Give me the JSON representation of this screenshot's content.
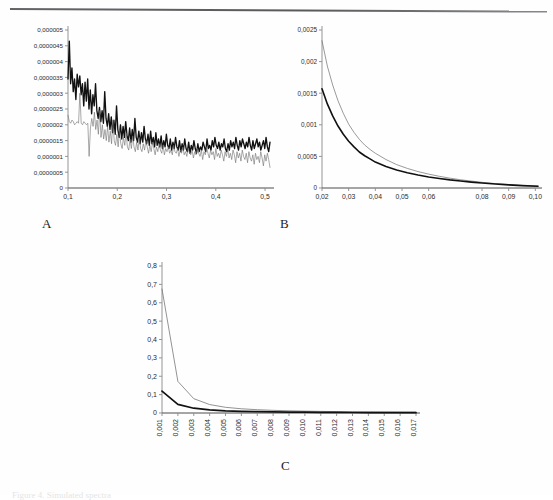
{
  "figure": {
    "caption_partial": "Figure 4. Simulated spectra",
    "panels": [
      "A",
      "B",
      "C"
    ],
    "top_rule": true
  },
  "colors": {
    "series_thick": "#111111",
    "series_thin": "#6f6f6f",
    "axis": "#8a8a8a",
    "text": "#2b2b2b",
    "background": "#fefefe"
  },
  "chart_data": [
    {
      "id": "A",
      "type": "line",
      "title": "",
      "xlabel": "",
      "ylabel": "",
      "grid": false,
      "legend": "none",
      "xlim": [
        0.1,
        0.51
      ],
      "ylim": [
        0,
        5e-06
      ],
      "xticks": [
        "0,1",
        "0,2",
        "0,3",
        "0,4",
        "0,5"
      ],
      "xtick_values": [
        0.1,
        0.2,
        0.3,
        0.4,
        0.5
      ],
      "yticks": [
        "0",
        "0,0000005",
        "0,000001",
        "0,0000015",
        "0,000002",
        "0,0000025",
        "0,000003",
        "0,0000035",
        "0,000004",
        "0,0000045",
        "0,000005"
      ],
      "ytick_values": [
        0,
        5e-07,
        1e-06,
        1.5e-06,
        2e-06,
        2.5e-06,
        3e-06,
        3.5e-06,
        4e-06,
        4.5e-06,
        5e-06
      ],
      "series": [
        {
          "name": "thick-black",
          "style": "thick",
          "values": [
            3.45,
            4.65,
            3.3,
            3.8,
            3.05,
            3.45,
            2.8,
            3.6,
            3.2,
            3.55,
            2.95,
            3.3,
            2.6,
            3.35,
            2.75,
            3.45,
            2.5,
            3.1,
            2.35,
            2.95,
            2.6,
            3.3,
            2.45,
            2.2,
            2.55,
            2.1,
            2.45,
            2.05,
            3.05,
            2.2,
            1.95,
            2.35,
            1.85,
            2.25,
            1.75,
            2.15,
            1.7,
            2.6,
            1.85,
            1.6,
            2.0,
            1.55,
            1.95,
            1.6,
            2.1,
            1.65,
            1.5,
            1.9,
            1.45,
            1.85,
            1.5,
            2.2,
            1.6,
            1.45,
            1.8,
            1.4,
            1.75,
            1.45,
            1.95,
            1.55,
            1.4,
            1.7,
            1.35,
            1.8,
            1.4,
            1.6,
            1.3,
            1.75,
            1.35,
            1.55,
            1.3,
            1.65,
            1.25,
            1.5,
            1.3,
            1.7,
            1.35,
            1.25,
            1.55,
            1.2,
            1.45,
            1.25,
            1.6,
            1.3,
            1.2,
            1.5,
            1.15,
            1.4,
            1.2,
            1.55,
            1.25,
            1.15,
            1.45,
            1.1,
            1.35,
            1.2,
            1.5,
            1.25,
            1.1,
            1.4,
            1.15,
            1.3,
            1.2,
            1.45,
            1.3,
            1.15,
            1.55,
            1.25,
            1.35,
            1.2,
            1.5,
            1.3,
            1.6,
            1.35,
            1.25,
            1.45,
            1.2,
            1.4,
            1.3,
            1.55,
            1.25,
            1.15,
            1.4,
            1.2,
            1.5,
            1.3,
            1.45,
            1.25,
            1.6,
            1.35,
            1.2,
            1.5,
            1.3,
            1.55,
            1.4,
            1.25,
            1.45,
            1.3,
            1.6,
            1.35,
            1.2,
            1.5,
            1.25,
            1.4,
            1.55,
            1.3,
            1.45,
            1.2,
            1.35,
            1.5,
            1.25,
            1.6,
            1.3,
            1.15,
            1.45
          ]
        },
        {
          "name": "thin-gray",
          "style": "thin",
          "values": [
            2.3,
            2.1,
            2.05,
            2.15,
            2.1,
            2.0,
            2.05,
            2.1,
            2.05,
            3.0,
            2.05,
            2.0,
            2.1,
            2.05,
            2.0,
            2.05,
            1.0,
            1.9,
            2.2,
            1.95,
            2.4,
            1.85,
            2.15,
            1.7,
            2.45,
            1.6,
            2.0,
            1.55,
            1.85,
            1.5,
            1.95,
            1.45,
            1.8,
            1.4,
            2.15,
            1.5,
            1.35,
            1.7,
            1.3,
            1.85,
            1.4,
            1.25,
            1.6,
            1.35,
            1.75,
            1.3,
            1.2,
            1.55,
            1.25,
            1.65,
            1.3,
            1.15,
            1.45,
            1.2,
            1.6,
            1.25,
            1.15,
            1.4,
            1.2,
            1.5,
            1.3,
            1.1,
            1.35,
            1.15,
            1.45,
            1.25,
            1.05,
            1.3,
            1.15,
            1.4,
            1.2,
            1.1,
            1.35,
            1.05,
            1.25,
            1.15,
            1.3,
            1.1,
            1.2,
            1.05,
            1.35,
            1.15,
            1.1,
            1.25,
            1.0,
            1.2,
            1.1,
            1.3,
            1.05,
            1.15,
            1.0,
            1.25,
            1.1,
            1.05,
            1.2,
            0.95,
            1.15,
            1.05,
            1.25,
            1.1,
            1.0,
            1.2,
            0.9,
            1.15,
            1.05,
            1.3,
            1.1,
            0.95,
            1.2,
            1.05,
            1.15,
            0.9,
            1.25,
            1.0,
            1.1,
            0.95,
            1.2,
            1.05,
            0.85,
            1.15,
            1.0,
            1.25,
            0.95,
            1.1,
            0.9,
            1.2,
            1.05,
            0.8,
            1.15,
            0.95,
            1.1,
            0.85,
            1.2,
            1.0,
            0.9,
            1.1,
            0.8,
            1.15,
            0.95,
            0.85,
            1.05,
            0.75,
            1.1,
            0.9,
            1.0,
            0.8,
            1.15,
            0.95,
            0.7,
            1.05,
            0.85,
            1.1,
            0.9,
            0.65
          ]
        }
      ]
    },
    {
      "id": "B",
      "type": "line",
      "title": "",
      "xlabel": "",
      "ylabel": "",
      "grid": false,
      "legend": "none",
      "xlim": [
        0.02,
        0.101
      ],
      "ylim": [
        0,
        0.0025
      ],
      "xticks": [
        "0,02",
        "0,03",
        "0,04",
        "0,05",
        "0,06",
        "0,08",
        "0,09",
        "0,10"
      ],
      "xtick_values": [
        0.02,
        0.03,
        0.04,
        0.05,
        0.06,
        0.08,
        0.09,
        0.1
      ],
      "yticks": [
        "0",
        "0,0005",
        "0,001",
        "0,0015",
        "0,002",
        "0,0025"
      ],
      "ytick_values": [
        0,
        0.0005,
        0.001,
        0.0015,
        0.002,
        0.0025
      ],
      "x": [
        0.02,
        0.022,
        0.024,
        0.026,
        0.028,
        0.03,
        0.032,
        0.034,
        0.036,
        0.038,
        0.04,
        0.044,
        0.048,
        0.052,
        0.056,
        0.06,
        0.064,
        0.068,
        0.072,
        0.076,
        0.08,
        0.085,
        0.09,
        0.095,
        0.101
      ],
      "series": [
        {
          "name": "thin-gray",
          "style": "thin",
          "values": [
            0.00233,
            0.00193,
            0.00163,
            0.00138,
            0.00118,
            0.00101,
            0.00088,
            0.00077,
            0.00068,
            0.00061,
            0.00055,
            0.00045,
            0.00037,
            0.00031,
            0.00026,
            0.00022,
            0.000185,
            0.000155,
            0.00013,
            0.00011,
            9e-05,
            7e-05,
            5.5e-05,
            4e-05,
            3e-05
          ]
        },
        {
          "name": "thick-black",
          "style": "thick",
          "values": [
            0.00157,
            0.00133,
            0.00114,
            0.00098,
            0.00085,
            0.00074,
            0.00065,
            0.00057,
            0.00051,
            0.00046,
            0.00041,
            0.00034,
            0.000285,
            0.00024,
            0.000205,
            0.000175,
            0.00015,
            0.000128,
            0.00011,
            9.3e-05,
            7.9e-05,
            6.3e-05,
            5e-05,
            3.8e-05,
            2.8e-05
          ]
        }
      ]
    },
    {
      "id": "C",
      "type": "line",
      "title": "",
      "xlabel": "",
      "ylabel": "",
      "grid": false,
      "legend": "none",
      "xlim": [
        0.001,
        0.017
      ],
      "ylim": [
        0,
        0.8
      ],
      "xticks": [
        "0,001",
        "0,002",
        "0,003",
        "0,004",
        "0,005",
        "0,006",
        "0,007",
        "0,008",
        "0,009",
        "0,010",
        "0,011",
        "0,012",
        "0,013",
        "0,014",
        "0,015",
        "0,016",
        "0,017"
      ],
      "xtick_values": [
        0.001,
        0.002,
        0.003,
        0.004,
        0.005,
        0.006,
        0.007,
        0.008,
        0.009,
        0.01,
        0.011,
        0.012,
        0.013,
        0.014,
        0.015,
        0.016,
        0.017
      ],
      "xtick_rotation": -90,
      "yticks": [
        "0",
        "0,1",
        "0,2",
        "0,3",
        "0,4",
        "0,5",
        "0,6",
        "0,7",
        "0,8"
      ],
      "ytick_values": [
        0,
        0.1,
        0.2,
        0.3,
        0.4,
        0.5,
        0.6,
        0.7,
        0.8
      ],
      "series": [
        {
          "name": "thin-gray",
          "style": "thin",
          "values": [
            0.675,
            0.172,
            0.078,
            0.046,
            0.031,
            0.023,
            0.018,
            0.0145,
            0.012,
            0.0102,
            0.0088,
            0.0076,
            0.0067,
            0.0059,
            0.0053,
            0.0047,
            0.0043
          ]
        },
        {
          "name": "thick-black",
          "style": "thick",
          "values": [
            0.119,
            0.047,
            0.026,
            0.017,
            0.012,
            0.0092,
            0.0073,
            0.006,
            0.005,
            0.0043,
            0.0037,
            0.0032,
            0.0028,
            0.0025,
            0.0023,
            0.0021,
            0.0019
          ]
        }
      ]
    }
  ]
}
